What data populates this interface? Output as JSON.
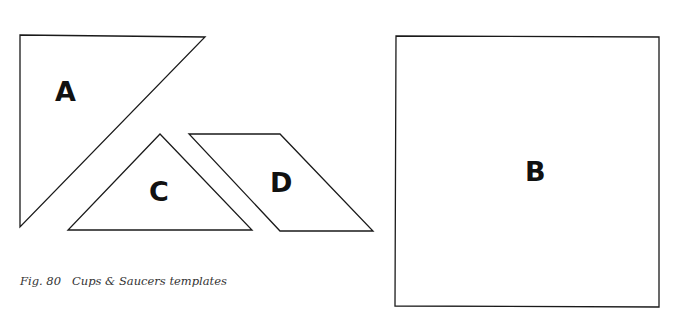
{
  "figure": {
    "caption_number": "Fig. 80",
    "caption_title": "Cups & Saucers templates",
    "caption_full": "Fig. 80   Cups & Saucers templates"
  },
  "templates": [
    {
      "id": "A",
      "label": "A",
      "shape": "right-triangle",
      "points": "20,35 205,37 20,227"
    },
    {
      "id": "B",
      "label": "B",
      "shape": "square",
      "points": "396,36 659,37 659,307 395,306"
    },
    {
      "id": "C",
      "label": "C",
      "shape": "isosceles-triangle",
      "points": "160,134 252,230 68,230"
    },
    {
      "id": "D",
      "label": "D",
      "shape": "parallelogram",
      "points": "189,134 280,134 373,231 280,231"
    }
  ],
  "colors": {
    "stroke": "#1a1a1a",
    "background": "#ffffff",
    "label": "#111111",
    "caption": "#333333"
  }
}
